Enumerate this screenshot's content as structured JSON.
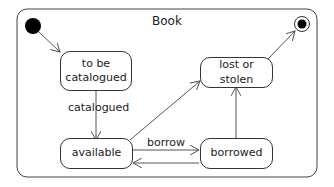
{
  "diagram": {
    "type": "uml-state-machine",
    "title": "Book",
    "states": [
      {
        "id": "to-be-catalogued",
        "label": "to be\ncatalogued"
      },
      {
        "id": "available",
        "label": "available"
      },
      {
        "id": "borrowed",
        "label": "borrowed"
      },
      {
        "id": "lost-or-stolen",
        "label": "lost or stolen"
      }
    ],
    "initial_label": "initial state",
    "final_label": "final state",
    "transitions": [
      {
        "from": "initial",
        "to": "to-be-catalogued",
        "label": ""
      },
      {
        "from": "to-be-catalogued",
        "to": "available",
        "label": "catalogued"
      },
      {
        "from": "available",
        "to": "borrowed",
        "label": "borrow"
      },
      {
        "from": "borrowed",
        "to": "available",
        "label": ""
      },
      {
        "from": "available",
        "to": "lost-or-stolen",
        "label": ""
      },
      {
        "from": "borrowed",
        "to": "lost-or-stolen",
        "label": ""
      },
      {
        "from": "lost-or-stolen",
        "to": "final",
        "label": ""
      }
    ],
    "colors": {
      "line": "#444444",
      "text": "#222222",
      "background": "#ffffff"
    }
  }
}
